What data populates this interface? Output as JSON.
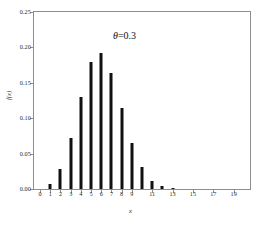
{
  "chart_data": {
    "type": "bar",
    "title": "",
    "annotation": "θ=0.3",
    "annotation_symbol": "θ",
    "annotation_rest": "=0.3",
    "xlabel": "x",
    "ylabel": "f(x)",
    "categories": [
      0,
      1,
      2,
      3,
      4,
      5,
      6,
      7,
      8,
      9,
      10,
      11,
      12,
      13,
      14,
      15,
      16,
      17,
      18,
      19,
      20
    ],
    "values": [
      0.0008,
      0.0068,
      0.0278,
      0.0716,
      0.1304,
      0.1789,
      0.1916,
      0.1643,
      0.1144,
      0.0654,
      0.0308,
      0.012,
      0.0039,
      0.001,
      0.0002,
      0.0,
      0.0,
      0.0,
      0.0,
      0.0,
      0.0
    ],
    "xlim": [
      -0.6,
      20.6
    ],
    "ylim": [
      0.0,
      0.25
    ],
    "yticks": [
      0.0,
      0.05,
      0.1,
      0.15,
      0.2,
      0.25
    ],
    "ytick_labels": [
      "0.00",
      "0.05",
      "0.10",
      "0.15",
      "0.20",
      "0.25"
    ],
    "xticks": [
      0,
      1,
      2,
      3,
      4,
      5,
      6,
      7,
      8,
      9,
      11,
      13,
      15,
      17,
      19
    ],
    "xtick_labels": [
      "0",
      "1",
      "2",
      "3",
      "4",
      "5",
      "6",
      "7",
      "8",
      "9",
      "11",
      "13",
      "15",
      "17",
      "19"
    ],
    "grid": false,
    "legend": false,
    "bar_color": "#111111",
    "frame_color": "#8e8e8e",
    "background": "#ffffff"
  }
}
